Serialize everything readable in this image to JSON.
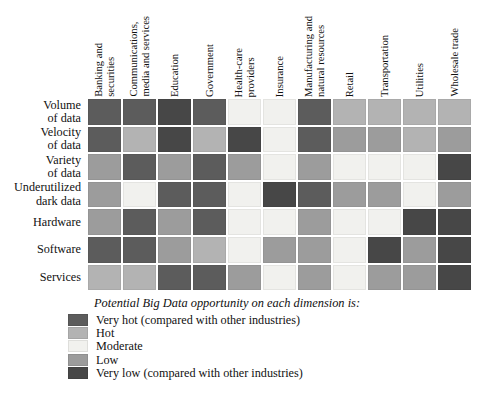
{
  "figure": {
    "legend_title": "Potential Big Data opportunity on each dimension is:"
  },
  "chart_data": {
    "type": "heatmap",
    "columns": [
      "Banking and\nsecurities",
      "Communications,\nmedia and services",
      "Education",
      "Government",
      "Health-care\nproviders",
      "Insurance",
      "Manufacturing and\nnatural resources",
      "Retail",
      "Transportation",
      "Utilities",
      "Wholesale trade"
    ],
    "rows": [
      "Volume\nof data",
      "Velocity\nof data",
      "Variety\nof data",
      "Underutilized\ndark data",
      "Hardware",
      "Software",
      "Services"
    ],
    "levels": [
      {
        "key": "very_hot",
        "label": "Very hot (compared with other industries)",
        "color": "#5c5c5c"
      },
      {
        "key": "hot",
        "label": "Hot",
        "color": "#b3b3b3"
      },
      {
        "key": "moderate",
        "label": "Moderate",
        "color": "#f1f1ee"
      },
      {
        "key": "low",
        "label": "Low",
        "color": "#9c9c9c"
      },
      {
        "key": "very_low",
        "label": "Very low (compared with other industries)",
        "color": "#474747"
      }
    ],
    "grid": [
      [
        "very_hot",
        "very_hot",
        "very_low",
        "very_hot",
        "moderate",
        "moderate",
        "very_hot",
        "hot",
        "hot",
        "hot",
        "hot"
      ],
      [
        "very_hot",
        "hot",
        "very_low",
        "hot",
        "very_low",
        "moderate",
        "very_hot",
        "low",
        "low",
        "hot",
        "low"
      ],
      [
        "low",
        "very_hot",
        "low",
        "very_hot",
        "low",
        "moderate",
        "low",
        "moderate",
        "moderate",
        "moderate",
        "very_low"
      ],
      [
        "low",
        "moderate",
        "very_hot",
        "very_hot",
        "moderate",
        "very_low",
        "very_hot",
        "low",
        "low",
        "moderate",
        "low"
      ],
      [
        "low",
        "very_hot",
        "low",
        "very_hot",
        "moderate",
        "moderate",
        "low",
        "moderate",
        "moderate",
        "very_low",
        "very_low"
      ],
      [
        "very_hot",
        "very_hot",
        "low",
        "hot",
        "moderate",
        "low",
        "low",
        "moderate",
        "very_low",
        "low",
        "very_low"
      ],
      [
        "hot",
        "hot",
        "very_hot",
        "very_hot",
        "low",
        "moderate",
        "low",
        "moderate",
        "low",
        "low",
        "very_low"
      ]
    ],
    "legend_position": "bottom-left",
    "grid_gap_color": "#ffffff"
  }
}
